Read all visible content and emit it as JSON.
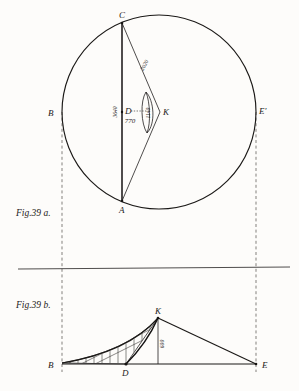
{
  "plate": {
    "title": "Fig. 39 a / Fig. 39 b geometric construction plate",
    "ink_color": "#1b1917",
    "paper_color": "#fdfcfa",
    "dash_color": "#6d6a66"
  },
  "figures": [
    {
      "id": "fig-39a",
      "caption": "Fig.39 a.",
      "description": "Circle with chord CA, triangle C-K-A and narrow lens (vesica) at centre D",
      "points": [
        {
          "name": "C",
          "label": "C",
          "x": 122,
          "y": 23,
          "label_dx": -1,
          "label_dy": -4
        },
        {
          "name": "A",
          "label": "A",
          "x": 122,
          "y": 200,
          "label_dx": -1,
          "label_dy": 11
        },
        {
          "name": "B",
          "label": "B",
          "x": 62,
          "y": 112,
          "label_dx": -10,
          "label_dy": 3
        },
        {
          "name": "D",
          "label": "D",
          "x": 122,
          "y": 112,
          "label_dx": 4,
          "label_dy": 1
        },
        {
          "name": "K",
          "label": "K",
          "x": 158,
          "y": 112,
          "label_dx": 5,
          "label_dy": 3
        },
        {
          "name": "Eprime",
          "label": "E'",
          "x": 256,
          "y": 112,
          "label_dx": 4,
          "label_dy": 2
        }
      ],
      "measures": [
        {
          "name": "chord-CK",
          "value": "2020",
          "x": 146,
          "y": 66,
          "rotate": -62
        },
        {
          "name": "segment-DK",
          "value": "770",
          "x": 130,
          "y": 121,
          "rotate": 0
        },
        {
          "name": "segment-CD",
          "value": "3640",
          "x": 117,
          "y": 112,
          "rotate": -90
        },
        {
          "name": "lens-width",
          "value": "1140",
          "x": 149,
          "y": 112,
          "rotate": -90
        }
      ]
    },
    {
      "id": "fig-39b",
      "caption": "Fig.39 b.",
      "description": "Base line B-E with curved cross-hatched region B-D-K and triangle K-D-E",
      "points": [
        {
          "name": "B",
          "label": "B",
          "x": 62,
          "y": 364,
          "label_dx": -10,
          "label_dy": 3
        },
        {
          "name": "D",
          "label": "D",
          "x": 126,
          "y": 364,
          "label_dx": -2,
          "label_dy": 11
        },
        {
          "name": "K",
          "label": "K",
          "x": 158,
          "y": 318,
          "label_dx": 0,
          "label_dy": -4
        },
        {
          "name": "E",
          "label": "E",
          "x": 256,
          "y": 364,
          "label_dx": 5,
          "label_dy": 3
        }
      ],
      "measures": [
        {
          "name": "height-KD",
          "value": "600",
          "x": 163,
          "y": 343,
          "rotate": -90
        }
      ]
    }
  ],
  "separator": {
    "name": "horizontal-rule",
    "y": 269,
    "x1": 18,
    "x2": 290
  },
  "projection_lines": [
    {
      "name": "projector-B",
      "x": 62,
      "y1": 112,
      "y2": 372
    },
    {
      "name": "projector-E",
      "x": 256,
      "y1": 112,
      "y2": 372
    }
  ]
}
